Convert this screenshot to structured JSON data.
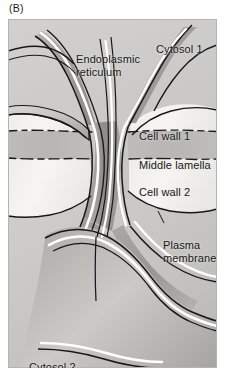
{
  "figure": {
    "panel_label": "(B)",
    "style": "grayscale textbook line illustration"
  },
  "labels": {
    "endoplasmic_reticulum": "Endoplasmic\nreticulum",
    "cytosol_1": "Cytosol 1",
    "cell_wall_1": "Cell wall 1",
    "middle_lamella": "Middle lamella",
    "cell_wall_2": "Cell wall 2",
    "plasma_membrane": "Plasma\nmembrane",
    "cytosol_2": "Cytosol 2"
  },
  "colors": {
    "cytosol": "#c9c8c6",
    "cell_wall": "#f2f1ee",
    "middle_lamella": "#bab9b6",
    "membrane_highlight": "#ffffff",
    "er_lumen_dark": "#8e8d8b",
    "er_shade": "#a9a8a5",
    "outline": "#15151a",
    "text": "#17171a",
    "page_background": "#ffffff"
  },
  "structures": [
    {
      "name": "cytosol-1-region",
      "description": "upper cytoplasm of cell 1"
    },
    {
      "name": "cytosol-2-region",
      "description": "lower cytoplasm of cell 2"
    },
    {
      "name": "cell-wall-1-region",
      "description": "pale wall band above middle lamella"
    },
    {
      "name": "middle-lamella-band",
      "description": "darker band between the two cell walls, bounded by dashed lines"
    },
    {
      "name": "cell-wall-2-region",
      "description": "pale wall band below middle lamella"
    },
    {
      "name": "plasma-membrane-lining",
      "description": "continuous white-highlighted membrane lining the plasmodesmatal channel"
    },
    {
      "name": "desmotubule-er",
      "description": "appressed ER tubule running through the centre of the channel"
    }
  ]
}
